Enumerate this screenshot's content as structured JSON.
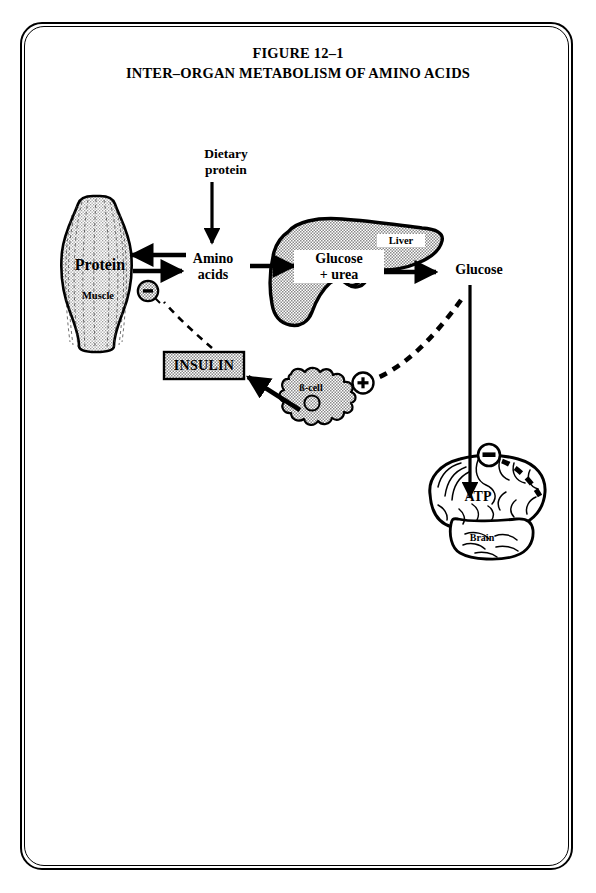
{
  "figure": {
    "number": "FIGURE 12–1",
    "caption": "INTER–ORGAN METABOLISM OF AMINO ACIDS",
    "frame": {
      "style": "double-rounded-rectangle",
      "color": "#000000"
    }
  },
  "labels": {
    "dietary_protein": "Dietary\nprotein",
    "dietary_protein_line1": "Dietary",
    "dietary_protein_line2": "protein",
    "amino_acids_line1": "Amino",
    "amino_acids_line2": "acids",
    "protein": "Protein",
    "muscle": "Muscle",
    "glucose_urea_line1": "Glucose",
    "glucose_urea_line2": "+ urea",
    "liver": "Liver",
    "glucose_right": "Glucose",
    "insulin": "INSULIN",
    "beta_cell": "ß-cell",
    "atp": "ATP",
    "brain": "Brain"
  },
  "signs": {
    "minus_muscle": "–",
    "plus_bcell": "+",
    "minus_brain": "–"
  },
  "colors": {
    "ink": "#000000",
    "paper": "#ffffff",
    "organ_fill": "#b8b8b8",
    "box_fill": "#c9c9c9"
  },
  "organs": [
    {
      "name": "muscle",
      "label": "Muscle",
      "content": "Protein"
    },
    {
      "name": "liver",
      "label": "Liver",
      "content": "Glucose + urea"
    },
    {
      "name": "beta-cell",
      "label": "ß-cell",
      "content": ""
    },
    {
      "name": "brain",
      "label": "Brain",
      "content": "ATP"
    }
  ],
  "flows": [
    {
      "from": "Dietary protein",
      "to": "Amino acids",
      "type": "solid-arrow"
    },
    {
      "from": "Amino acids",
      "to": "Protein",
      "type": "solid-arrow"
    },
    {
      "from": "Protein",
      "to": "Amino acids",
      "type": "solid-arrow"
    },
    {
      "from": "Amino acids",
      "to": "Liver",
      "type": "solid-arrow"
    },
    {
      "from": "Liver",
      "to": "Glucose",
      "type": "solid-arrow"
    },
    {
      "from": "Glucose",
      "to": "Brain",
      "type": "solid-arrow"
    },
    {
      "from": "ß-cell",
      "to": "INSULIN",
      "type": "solid-arrow"
    },
    {
      "from": "INSULIN",
      "to": "minus-muscle",
      "type": "dashed"
    },
    {
      "from": "Glucose",
      "to": "plus-bcell",
      "type": "dashed"
    },
    {
      "from": "Brain",
      "to": "minus-brain",
      "type": "dashed"
    }
  ]
}
